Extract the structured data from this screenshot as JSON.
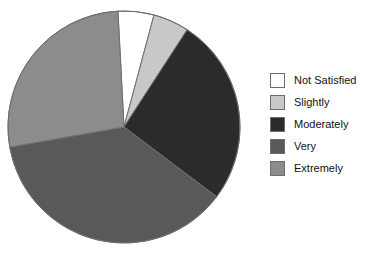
{
  "chart_data": {
    "type": "pie",
    "title": "",
    "subtitle": "",
    "xlabel": "",
    "ylabel": "",
    "legend_position": "right",
    "grid": false,
    "categories": [
      "Not Satisfied",
      "Slightly",
      "Moderately",
      "Very",
      "Extremely"
    ],
    "values": [
      5,
      5,
      26,
      37,
      27
    ],
    "units": "percent",
    "start_angle_deg": -3,
    "direction": "clockwise",
    "slices": [
      {
        "label": "Not Satisfied",
        "value": 5,
        "color": "#ffffff",
        "start_deg": -3,
        "end_deg": 15
      },
      {
        "label": "Slightly",
        "value": 5,
        "color": "#c8c8c8",
        "start_deg": 15,
        "end_deg": 33
      },
      {
        "label": "Moderately",
        "value": 26,
        "color": "#2b2b2b",
        "start_deg": 33,
        "end_deg": 127
      },
      {
        "label": "Very",
        "value": 37,
        "color": "#595959",
        "start_deg": 127,
        "end_deg": 260
      },
      {
        "label": "Extremely",
        "value": 27,
        "color": "#8c8c8c",
        "start_deg": 260,
        "end_deg": 357
      }
    ],
    "geometry": {
      "center_x": 124,
      "center_y": 127,
      "radius": 116,
      "outline_color": "#6e6e6e"
    }
  },
  "legend": {
    "items": [
      {
        "label": "Not Satisfied",
        "color": "#ffffff"
      },
      {
        "label": "Slightly",
        "color": "#c8c8c8"
      },
      {
        "label": "Moderately",
        "color": "#2b2b2b"
      },
      {
        "label": "Very",
        "color": "#595959"
      },
      {
        "label": "Extremely",
        "color": "#8c8c8c"
      }
    ]
  },
  "colors": {
    "background": "#ffffff",
    "text": "#111111",
    "swatch_border": "#6e6e6e",
    "slice_border": "#6e6e6e"
  }
}
